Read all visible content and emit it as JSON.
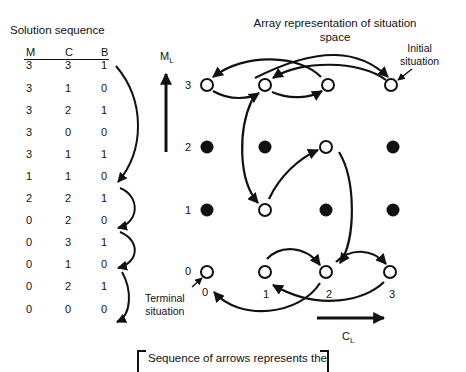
{
  "sequence": {
    "title": "Solution sequence",
    "headers": [
      "M",
      "C",
      "B"
    ],
    "rows": [
      [
        "3",
        "3",
        "1"
      ],
      [
        "3",
        "1",
        "0"
      ],
      [
        "3",
        "2",
        "1"
      ],
      [
        "3",
        "0",
        "0"
      ],
      [
        "3",
        "1",
        "1"
      ],
      [
        "1",
        "1",
        "0"
      ],
      [
        "2",
        "2",
        "1"
      ],
      [
        "0",
        "2",
        "0"
      ],
      [
        "0",
        "3",
        "1"
      ],
      [
        "0",
        "1",
        "0"
      ],
      [
        "0",
        "2",
        "1"
      ],
      [
        "0",
        "0",
        "0"
      ]
    ]
  },
  "diagram": {
    "title": "Array representation of situation space",
    "y_axis_label": "M",
    "y_axis_sub": "L",
    "x_axis_label": "C",
    "x_axis_sub": "L",
    "row_labels": [
      "3",
      "2",
      "1",
      "0"
    ],
    "col_labels": [
      "0",
      "1",
      "2",
      "3"
    ],
    "initial_label_line1": "Initial",
    "initial_label_line2": "situation",
    "terminal_label_line1": "Terminal",
    "terminal_label_line2": "situation",
    "open_nodes": [
      [
        3,
        3
      ],
      [
        3,
        1
      ],
      [
        3,
        2
      ],
      [
        3,
        0
      ],
      [
        1,
        1
      ],
      [
        2,
        2
      ],
      [
        0,
        2
      ],
      [
        0,
        3
      ],
      [
        0,
        1
      ],
      [
        0,
        0
      ]
    ],
    "filled_nodes": [
      [
        2,
        0
      ],
      [
        2,
        1
      ],
      [
        2,
        3
      ],
      [
        1,
        0
      ],
      [
        1,
        2
      ],
      [
        1,
        3
      ]
    ],
    "path": [
      [
        3,
        3
      ],
      [
        3,
        1
      ],
      [
        3,
        2
      ],
      [
        3,
        0
      ],
      [
        3,
        1
      ],
      [
        1,
        1
      ],
      [
        2,
        2
      ],
      [
        0,
        2
      ],
      [
        0,
        3
      ],
      [
        0,
        1
      ],
      [
        0,
        2
      ],
      [
        0,
        0
      ]
    ]
  },
  "footer": {
    "note": "Sequence of arrows represents the"
  }
}
